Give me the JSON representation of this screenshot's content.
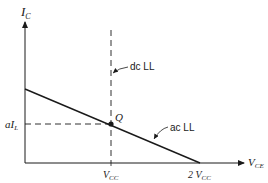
{
  "diagram": {
    "type": "load-line-graph",
    "axes": {
      "y_label_main": "I",
      "y_label_sub": "C",
      "x_label_main": "V",
      "x_label_sub": "CE"
    },
    "labels": {
      "q_point": "Q",
      "dc_load_line": "dc LL",
      "ac_load_line": "ac LL",
      "current_level_prefix": "aI",
      "current_level_sub": "L",
      "vcc_main": "V",
      "vcc_sub": "CC",
      "two_vcc_prefix": "2 V",
      "two_vcc_sub": "CC"
    },
    "colors": {
      "stroke": "#1a1a1a",
      "background": "#ffffff"
    }
  }
}
